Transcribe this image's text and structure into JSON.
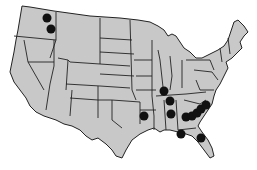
{
  "map": {
    "region": "Contiguous United States",
    "fill_color": "#c8c8c8",
    "border_color": "#222222",
    "marker_color": "#111111",
    "markers": [
      {
        "label": "Washington marker 1",
        "x": 47,
        "y": 18
      },
      {
        "label": "Washington marker 2",
        "x": 51,
        "y": 29
      },
      {
        "label": "Illinois marker",
        "x": 164,
        "y": 91
      },
      {
        "label": "Tennessee marker",
        "x": 170,
        "y": 101
      },
      {
        "label": "Mississippi/Alabama marker",
        "x": 171,
        "y": 114
      },
      {
        "label": "Arkansas/Oklahoma marker",
        "x": 144,
        "y": 116
      },
      {
        "label": "Georgia marker 1",
        "x": 186,
        "y": 117
      },
      {
        "label": "Georgia marker 2",
        "x": 192,
        "y": 116
      },
      {
        "label": "Georgia marker 3",
        "x": 197,
        "y": 113
      },
      {
        "label": "South Carolina marker 1",
        "x": 201,
        "y": 109
      },
      {
        "label": "South Carolina marker 2",
        "x": 206,
        "y": 105
      },
      {
        "label": "Florida panhandle marker",
        "x": 181,
        "y": 134
      },
      {
        "label": "Florida marker",
        "x": 201,
        "y": 138
      }
    ]
  }
}
